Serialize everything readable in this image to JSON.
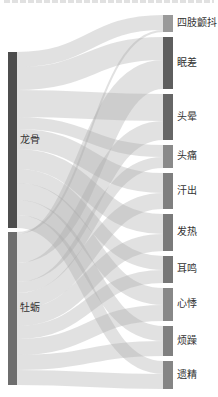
{
  "chart_data": {
    "type": "sankey",
    "title": "",
    "colors": {
      "link": "#a8a8a8",
      "link_opacity": 0.35,
      "label": "#333333"
    },
    "sources": [
      {
        "name": "龙骨",
        "color": "#4d4d4d"
      },
      {
        "name": "牡蛎",
        "color": "#6e6e6e"
      }
    ],
    "targets": [
      {
        "name": "四肢颤抖",
        "color": "#9a9a9a"
      },
      {
        "name": "眠差",
        "color": "#5e5e5e"
      },
      {
        "name": "头晕",
        "color": "#666666"
      },
      {
        "name": "头痛",
        "color": "#8a8a8a"
      },
      {
        "name": "汗出",
        "color": "#7f7f7f"
      },
      {
        "name": "发热",
        "color": "#7a7a7a"
      },
      {
        "name": "耳鸣",
        "color": "#777777"
      },
      {
        "name": "心悸",
        "color": "#888888"
      },
      {
        "name": "烦躁",
        "color": "#808080"
      },
      {
        "name": "遗精",
        "color": "#858585"
      }
    ],
    "links": [
      {
        "source": "龙骨",
        "target": "四肢颤抖",
        "value": 15
      },
      {
        "source": "龙骨",
        "target": "眠差",
        "value": 23
      },
      {
        "source": "龙骨",
        "target": "头晕",
        "value": 27
      },
      {
        "source": "龙骨",
        "target": "头痛",
        "value": 12
      },
      {
        "source": "龙骨",
        "target": "汗出",
        "value": 20
      },
      {
        "source": "龙骨",
        "target": "发热",
        "value": 20
      },
      {
        "source": "龙骨",
        "target": "耳鸣",
        "value": 14
      },
      {
        "source": "龙骨",
        "target": "心悸",
        "value": 17
      },
      {
        "source": "龙骨",
        "target": "烦躁",
        "value": 15
      },
      {
        "source": "龙骨",
        "target": "遗精",
        "value": 13
      },
      {
        "source": "牡蛎",
        "target": "四肢颤抖",
        "value": 2
      },
      {
        "source": "牡蛎",
        "target": "眠差",
        "value": 29
      },
      {
        "source": "牡蛎",
        "target": "头晕",
        "value": 19
      },
      {
        "source": "牡蛎",
        "target": "头痛",
        "value": 11
      },
      {
        "source": "牡蛎",
        "target": "汗出",
        "value": 16
      },
      {
        "source": "牡蛎",
        "target": "发热",
        "value": 17
      },
      {
        "source": "牡蛎",
        "target": "耳鸣",
        "value": 13
      },
      {
        "source": "牡蛎",
        "target": "心悸",
        "value": 16
      },
      {
        "source": "牡蛎",
        "target": "烦躁",
        "value": 15
      },
      {
        "source": "牡蛎",
        "target": "遗精",
        "value": 15
      }
    ]
  }
}
